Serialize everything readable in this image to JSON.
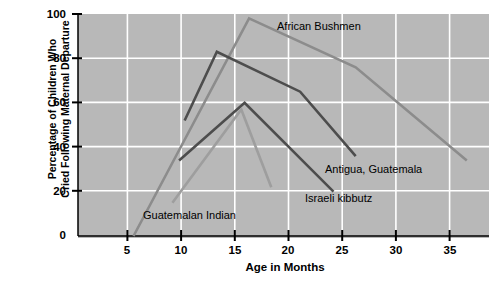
{
  "chart_data": {
    "type": "line",
    "title": "",
    "xlabel": "Age in Months",
    "ylabel": "Percentage of Children Who Cried Following Maternal Departure",
    "ylabel_line1": "Percentage of Children Who",
    "ylabel_line2": "Cried Following Maternal Departure",
    "xlim": [
      0,
      37
    ],
    "ylim": [
      0,
      100
    ],
    "xticks": [
      5,
      10,
      15,
      20,
      25,
      30,
      35
    ],
    "yticks": [
      0,
      20,
      40,
      60,
      80,
      100
    ],
    "grid": true,
    "grid_color": "#ffffff",
    "plot_background": "#b8b8b8",
    "legend_position": "inline-annotations",
    "series": [
      {
        "name": "African Bushmen",
        "color": "#8c8c8c",
        "label_x_months": 20.6,
        "label_y_percent": 93,
        "points": [
          {
            "x": 5,
            "y": 0
          },
          {
            "x": 15.4,
            "y": 98
          },
          {
            "x": 25,
            "y": 76
          },
          {
            "x": 35,
            "y": 34
          }
        ]
      },
      {
        "name": "Antigua, Guatemala",
        "color": "#4d4d4d",
        "label_x_months": 25.5,
        "label_y_percent": 37,
        "points": [
          {
            "x": 9.6,
            "y": 52
          },
          {
            "x": 12.5,
            "y": 83
          },
          {
            "x": 20,
            "y": 65
          },
          {
            "x": 25,
            "y": 36
          }
        ]
      },
      {
        "name": "Israeli kibbutz",
        "color": "#4d4d4d",
        "label_x_months": 19.3,
        "label_y_percent": 22,
        "points": [
          {
            "x": 9.1,
            "y": 34
          },
          {
            "x": 15,
            "y": 60
          },
          {
            "x": 23,
            "y": 20
          }
        ]
      },
      {
        "name": "Guatemalan Indian",
        "color": "#9e9e9e",
        "label_x_months": 10.6,
        "label_y_percent": 9,
        "points": [
          {
            "x": 8.5,
            "y": 15
          },
          {
            "x": 14.7,
            "y": 57
          },
          {
            "x": 17.4,
            "y": 22
          }
        ]
      }
    ]
  },
  "axes": {
    "y_tick_labels": [
      "100",
      "80",
      "60",
      "40",
      "20",
      "0"
    ],
    "x_tick_labels": [
      "5",
      "10",
      "15",
      "20",
      "25",
      "30",
      "35"
    ],
    "x_axis_title": "Age in Months",
    "y_axis_title_line1": "Percentage of Children Who",
    "y_axis_title_line2": "Cried Following Maternal Departure"
  },
  "annotations": {
    "african_bushmen": "African Bushmen",
    "antigua_guatemala": "Antigua, Guatemala",
    "israeli_kibbutz": "Israeli kibbutz",
    "guatemalan_indian": "Guatemalan Indian"
  }
}
